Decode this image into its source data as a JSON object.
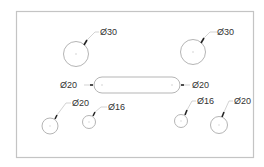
{
  "drawing": {
    "title": "Plate with holes and slot",
    "colors": {
      "outline": "#b5b5b5",
      "text": "#333333",
      "frame": "#c4c4c4"
    },
    "features": [
      {
        "id": "hole-top-left",
        "type": "hole",
        "label": "Ø30"
      },
      {
        "id": "hole-top-right",
        "type": "hole",
        "label": "Ø30"
      },
      {
        "id": "slot-center",
        "type": "slot",
        "label_left": "Ø20",
        "label_right": "Ø20"
      },
      {
        "id": "hole-bottom-1",
        "type": "hole",
        "label": "Ø20"
      },
      {
        "id": "hole-bottom-2",
        "type": "hole",
        "label": "Ø16"
      },
      {
        "id": "hole-bottom-3",
        "type": "hole",
        "label": "Ø16"
      },
      {
        "id": "hole-bottom-4",
        "type": "hole",
        "label": "Ø20"
      }
    ]
  }
}
